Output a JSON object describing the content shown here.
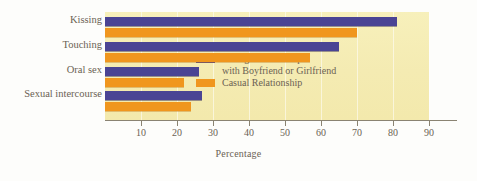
{
  "chart_data": {
    "type": "bar",
    "orientation": "horizontal",
    "title": "",
    "xlabel": "Percentage",
    "ylabel": "",
    "xlim": [
      0,
      97
    ],
    "ticks": [
      10,
      20,
      30,
      40,
      50,
      60,
      70,
      80,
      90
    ],
    "grid": "vertical-light",
    "legend_position": "inside-right",
    "categories": [
      "Kissing",
      "Touching",
      "Oral sex",
      "Sexual intercourse"
    ],
    "series": [
      {
        "name": "Dating Relationship with Boyfriend or Girlfriend",
        "name_line1": "Dating Relationship",
        "name_line2": "with Boyfriend or Girlfriend",
        "color": "#4a4494",
        "values": [
          81,
          65,
          26,
          27
        ]
      },
      {
        "name": "Casual Relationship",
        "name_line1": "Casual Relationship",
        "name_line2": "",
        "color": "#f0961e",
        "values": [
          70,
          57,
          22,
          24
        ]
      }
    ],
    "colors": {
      "series0": "#4a4494",
      "series1": "#f0961e",
      "plot_background": "#f4ebb2",
      "axis": "#8a8372",
      "text": "#6b6254"
    }
  }
}
